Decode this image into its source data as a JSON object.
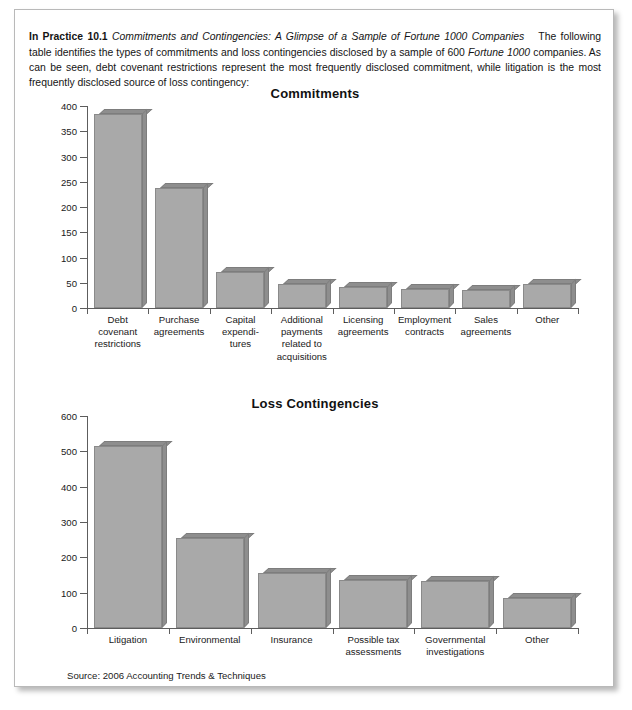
{
  "document": {
    "intro": {
      "lead": "In Practice 10.1",
      "title_italic": "Commitments and Contingencies: A Glimpse of a Sample of Fortune 1000 Companies",
      "body_part1": "The following table identifies the types of commitments and loss contingencies disclosed by a sample of 600 ",
      "body_italic": "Fortune 1000",
      "body_part2": " companies. As can be seen, debt covenant restrictions represent the most frequently disclosed commitment, while litigation is the most frequently disclosed source of loss contingency:"
    },
    "source": "Source: 2006 Accounting Trends & Techniques"
  },
  "chart_data": [
    {
      "type": "bar",
      "title": "Commitments",
      "xlabel": "",
      "ylabel": "",
      "ylim": [
        0,
        400
      ],
      "yticks": [
        0,
        50,
        100,
        150,
        200,
        250,
        300,
        350,
        400
      ],
      "grid": false,
      "legend": null,
      "categories": [
        "Debt\ncovenant\nrestrictions",
        "Purchase\nagreements",
        "Capital\nexpendi-\ntures",
        "Additional\npayments\nrelated to\nacquisitions",
        "Licensing\nagreements",
        "Employment\ncontracts",
        "Sales\nagreements",
        "Other"
      ],
      "values": [
        385,
        238,
        72,
        48,
        42,
        38,
        35,
        48
      ]
    },
    {
      "type": "bar",
      "title": "Loss Contingencies",
      "xlabel": "",
      "ylabel": "",
      "ylim": [
        0,
        600
      ],
      "yticks": [
        0,
        100,
        200,
        300,
        400,
        500,
        600
      ],
      "grid": false,
      "legend": null,
      "categories": [
        "Litigation",
        "Environmental",
        "Insurance",
        "Possible tax\nassessments",
        "Governmental\ninvestigations",
        "Other"
      ],
      "values": [
        515,
        255,
        155,
        135,
        132,
        85
      ]
    }
  ],
  "colors": {
    "bar_face": "#a9a9a9",
    "bar_shade": "#8e8e8e",
    "axis": "#5d5d5d",
    "border": "#b9b9b9",
    "text": "#1a1a1a"
  }
}
